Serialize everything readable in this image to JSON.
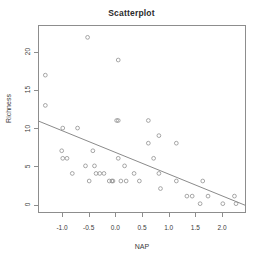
{
  "chart_data": {
    "type": "scatter",
    "title": "Scatterplot",
    "xlabel": "NAP",
    "ylabel": "Richness",
    "xlim": [
      -1.45,
      2.45
    ],
    "ylim": [
      -1.1,
      23.5
    ],
    "grid": false,
    "legend": null,
    "marker": "open-circle",
    "marker_color": "#8a8a8a",
    "line_color": "#7c7c7c",
    "frame_color": "#8d8d8d",
    "xticks": [
      -1.0,
      -0.5,
      0.0,
      0.5,
      1.0,
      1.5,
      2.0
    ],
    "xtick_labels": [
      "-1.0",
      "-0.5",
      "0.0",
      "0.5",
      "1.0",
      "1.5",
      "2.0"
    ],
    "yticks": [
      0,
      5,
      10,
      15,
      20
    ],
    "ytick_labels": [
      "0",
      "5",
      "10",
      "15",
      "20"
    ],
    "points": [
      {
        "x": -1.33,
        "y": 17
      },
      {
        "x": -1.33,
        "y": 13
      },
      {
        "x": -1.0,
        "y": 10
      },
      {
        "x": -1.02,
        "y": 7
      },
      {
        "x": -1.0,
        "y": 6
      },
      {
        "x": -0.92,
        "y": 6
      },
      {
        "x": -0.82,
        "y": 4
      },
      {
        "x": -0.72,
        "y": 10
      },
      {
        "x": -0.57,
        "y": 5
      },
      {
        "x": -0.53,
        "y": 22
      },
      {
        "x": -0.5,
        "y": 3
      },
      {
        "x": -0.43,
        "y": 7
      },
      {
        "x": -0.4,
        "y": 5
      },
      {
        "x": -0.37,
        "y": 4
      },
      {
        "x": -0.3,
        "y": 4
      },
      {
        "x": -0.22,
        "y": 4
      },
      {
        "x": -0.12,
        "y": 3
      },
      {
        "x": -0.07,
        "y": 3
      },
      {
        "x": -0.05,
        "y": 3
      },
      {
        "x": 0.02,
        "y": 11
      },
      {
        "x": 0.05,
        "y": 11
      },
      {
        "x": 0.05,
        "y": 19
      },
      {
        "x": 0.05,
        "y": 6
      },
      {
        "x": 0.1,
        "y": 3
      },
      {
        "x": 0.17,
        "y": 5
      },
      {
        "x": 0.2,
        "y": 3
      },
      {
        "x": 0.35,
        "y": 4
      },
      {
        "x": 0.45,
        "y": 3
      },
      {
        "x": 0.62,
        "y": 11
      },
      {
        "x": 0.62,
        "y": 8
      },
      {
        "x": 0.72,
        "y": 6
      },
      {
        "x": 0.82,
        "y": 9
      },
      {
        "x": 0.82,
        "y": 4
      },
      {
        "x": 0.85,
        "y": 2
      },
      {
        "x": 1.15,
        "y": 8
      },
      {
        "x": 1.15,
        "y": 3
      },
      {
        "x": 1.35,
        "y": 1
      },
      {
        "x": 1.45,
        "y": 1
      },
      {
        "x": 1.6,
        "y": 0
      },
      {
        "x": 1.65,
        "y": 3
      },
      {
        "x": 1.75,
        "y": 1
      },
      {
        "x": 2.03,
        "y": 0
      },
      {
        "x": 2.25,
        "y": 1
      },
      {
        "x": 2.28,
        "y": 0
      }
    ],
    "regression_line": {
      "x1": -1.45,
      "y1": 10.9,
      "x2": 2.45,
      "y2": -0.2
    }
  }
}
